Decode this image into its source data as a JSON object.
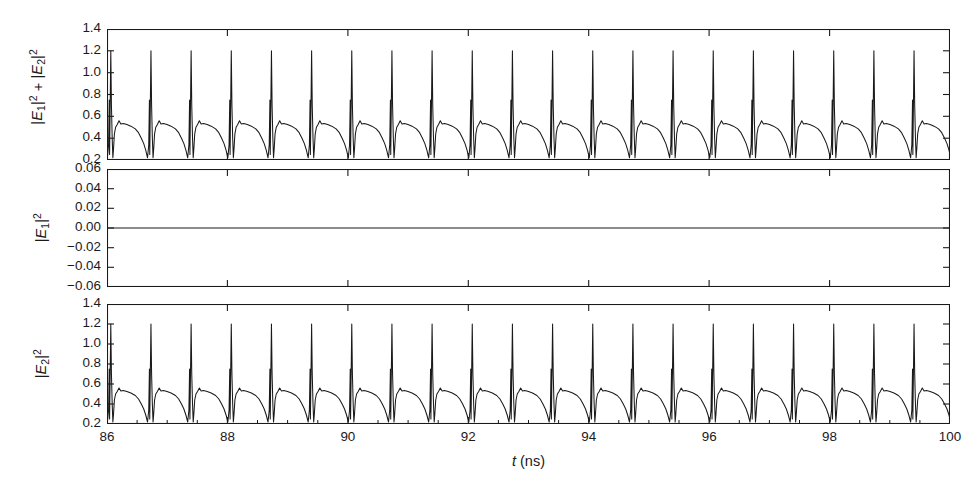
{
  "figure": {
    "background_color": "#ffffff",
    "line_color": "#1a1a1a",
    "axis_color": "#1a1a1a",
    "xlabel_var": "t",
    "xlabel_unit": "(ns)"
  },
  "chart_data": {
    "type": "line",
    "title": "",
    "subtitle": "",
    "xlabel": "t (ns)",
    "grid": false,
    "legend": "none",
    "shared_x": true,
    "xlim": [
      86,
      100
    ],
    "xticks": [
      86,
      88,
      90,
      92,
      94,
      96,
      98,
      100
    ],
    "xtick_labels": [
      "86",
      "88",
      "90",
      "92",
      "94",
      "96",
      "98",
      "100"
    ],
    "x_minor_tick_step": 0.5,
    "pulse_period_ns": 0.667,
    "panels": [
      {
        "id": "panel-sum",
        "ylabel": "|E1|^2 + |E2|^2",
        "ylabel_parts": [
          {
            "bar": "|",
            "var": "E",
            "sub": "1",
            "bar2": "|",
            "sup": "2"
          },
          {
            "op": " + "
          },
          {
            "bar": "|",
            "var": "E",
            "sub": "2",
            "bar2": "|",
            "sup": "2"
          }
        ],
        "ylim": [
          0.2,
          1.4
        ],
        "yticks": [
          0.2,
          0.4,
          0.6,
          0.8,
          1.0,
          1.2,
          1.4
        ],
        "ytick_labels": [
          "0.2",
          "0.4",
          "0.6",
          "0.8",
          "1.0",
          "1.2",
          "1.4"
        ],
        "waveform": "pulse-train",
        "peak_value": 1.2,
        "trough_value": 0.22,
        "plateau_value": 0.52,
        "bump_value": 0.56,
        "series_name": "|E1|^2 + |E2|^2"
      },
      {
        "id": "panel-e1",
        "ylabel": "|E1|^2",
        "ylabel_parts": [
          {
            "bar": "|",
            "var": "E",
            "sub": "1",
            "bar2": "|",
            "sup": "2"
          }
        ],
        "ylim": [
          -0.06,
          0.06
        ],
        "yticks": [
          -0.06,
          -0.04,
          -0.02,
          0.0,
          0.02,
          0.04,
          0.06
        ],
        "ytick_labels": [
          "−0.06",
          "−0.04",
          "−0.02",
          "0.00",
          "0.02",
          "0.04",
          "0.06"
        ],
        "waveform": "flat-zero",
        "constant_value": 0.0,
        "series_name": "|E1|^2"
      },
      {
        "id": "panel-e2",
        "ylabel": "|E2|^2",
        "ylabel_parts": [
          {
            "bar": "|",
            "var": "E",
            "sub": "2",
            "bar2": "|",
            "sup": "2"
          }
        ],
        "ylim": [
          0.2,
          1.4
        ],
        "yticks": [
          0.2,
          0.4,
          0.6,
          0.8,
          1.0,
          1.2,
          1.4
        ],
        "ytick_labels": [
          "0.2",
          "0.4",
          "0.6",
          "0.8",
          "1.0",
          "1.2",
          "1.4"
        ],
        "waveform": "pulse-train",
        "peak_value": 1.2,
        "trough_value": 0.22,
        "plateau_value": 0.52,
        "bump_value": 0.56,
        "series_name": "|E2|^2"
      }
    ]
  }
}
